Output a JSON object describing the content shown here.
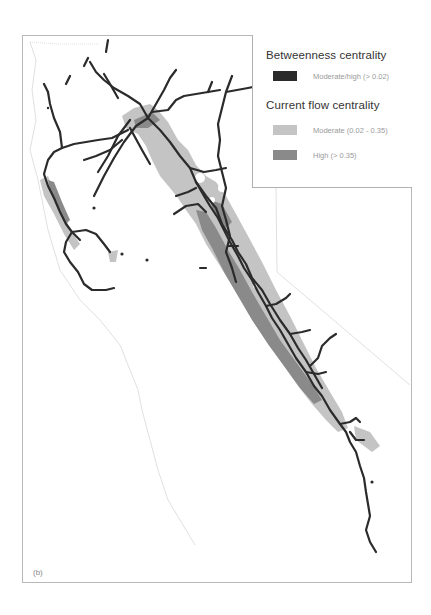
{
  "figure": {
    "panel_label": "(b)",
    "region": "California (Sierra Nevada corridor)"
  },
  "legend": {
    "sections": [
      {
        "title": "Betweenness centrality",
        "items": [
          {
            "label": "Moderate/high (> 0.02)",
            "color": "#2b2b2b"
          }
        ]
      },
      {
        "title": "Current flow centrality",
        "items": [
          {
            "label": "Moderate (0.02 - 0.35)",
            "color": "#c4c4c4"
          },
          {
            "label": "High (> 0.35)",
            "color": "#8a8a8a"
          }
        ]
      }
    ]
  },
  "colors": {
    "network_line": "#2b2b2b",
    "flow_moderate": "#c4c4c4",
    "flow_high": "#8a8a8a",
    "boundary": "#d6d6d6",
    "frame": "#b8b8b8"
  }
}
